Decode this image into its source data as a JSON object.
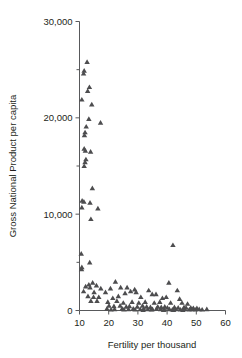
{
  "chart_data": {
    "type": "scatter",
    "title": "",
    "xlabel": "Fertility per thousand",
    "ylabel": "Gross National Product per capita",
    "xlim": [
      10,
      60
    ],
    "ylim": [
      0,
      30000
    ],
    "xticks": [
      10,
      20,
      30,
      40,
      50,
      60
    ],
    "xticklabels": [
      "10",
      "20",
      "30",
      "40",
      "50",
      "60"
    ],
    "yticks": [
      0,
      10000,
      20000,
      30000
    ],
    "yticklabels": [
      "0",
      "10,000",
      "20,000",
      "30,000"
    ],
    "yticks_minor": [
      5000,
      15000,
      25000
    ],
    "grid": false,
    "legend": null,
    "marker": "triangle",
    "marker_color": "#4d4d4f",
    "points": [
      [
        12.6,
        25800
      ],
      [
        11.6,
        24900
      ],
      [
        11.4,
        24600
      ],
      [
        13.4,
        23200
      ],
      [
        12.8,
        22800
      ],
      [
        10.8,
        21900
      ],
      [
        14.2,
        21400
      ],
      [
        13.2,
        19900
      ],
      [
        17.2,
        19500
      ],
      [
        12.3,
        19100
      ],
      [
        11.9,
        18500
      ],
      [
        11.7,
        18200
      ],
      [
        11.6,
        16800
      ],
      [
        12.0,
        16600
      ],
      [
        13.8,
        16500
      ],
      [
        12.2,
        15700
      ],
      [
        11.9,
        15400
      ],
      [
        11.6,
        15000
      ],
      [
        14.4,
        12700
      ],
      [
        10.9,
        11400
      ],
      [
        11.5,
        11300
      ],
      [
        13.6,
        11200
      ],
      [
        10.8,
        10700
      ],
      [
        16.3,
        10600
      ],
      [
        13.9,
        9500
      ],
      [
        10.6,
        5900
      ],
      [
        13.5,
        5000
      ],
      [
        10.8,
        4500
      ],
      [
        10.7,
        4300
      ],
      [
        42.0,
        6800
      ],
      [
        14.5,
        2900
      ],
      [
        13.2,
        2700
      ],
      [
        15.8,
        2600
      ],
      [
        22.3,
        3000
      ],
      [
        40.6,
        2900
      ],
      [
        12.1,
        2500
      ],
      [
        13.6,
        2400
      ],
      [
        17.3,
        2300
      ],
      [
        20.6,
        2300
      ],
      [
        24.1,
        2400
      ],
      [
        26.3,
        2400
      ],
      [
        28.9,
        2200
      ],
      [
        33.7,
        2100
      ],
      [
        43.5,
        2100
      ],
      [
        11.4,
        2000
      ],
      [
        15.0,
        1900
      ],
      [
        18.9,
        1900
      ],
      [
        25.6,
        1800
      ],
      [
        27.5,
        2000
      ],
      [
        29.4,
        1900
      ],
      [
        34.9,
        1700
      ],
      [
        36.2,
        1700
      ],
      [
        12.9,
        1500
      ],
      [
        14.8,
        1400
      ],
      [
        16.6,
        1400
      ],
      [
        21.4,
        1300
      ],
      [
        23.3,
        1500
      ],
      [
        31.0,
        1400
      ],
      [
        38.4,
        1300
      ],
      [
        39.7,
        1400
      ],
      [
        44.3,
        1200
      ],
      [
        13.9,
        1000
      ],
      [
        16.0,
        1000
      ],
      [
        19.7,
        900
      ],
      [
        22.8,
        1000
      ],
      [
        25.0,
        800
      ],
      [
        28.0,
        900
      ],
      [
        30.3,
        800
      ],
      [
        32.5,
        900
      ],
      [
        35.6,
        800
      ],
      [
        37.5,
        900
      ],
      [
        41.2,
        800
      ],
      [
        45.1,
        800
      ],
      [
        47.0,
        700
      ],
      [
        20.1,
        500
      ],
      [
        21.8,
        450
      ],
      [
        23.9,
        500
      ],
      [
        26.0,
        400
      ],
      [
        27.1,
        450
      ],
      [
        29.8,
        400
      ],
      [
        31.6,
        500
      ],
      [
        33.0,
        400
      ],
      [
        34.3,
        350
      ],
      [
        36.8,
        400
      ],
      [
        38.0,
        350
      ],
      [
        39.2,
        400
      ],
      [
        40.1,
        300
      ],
      [
        42.5,
        350
      ],
      [
        43.8,
        300
      ],
      [
        45.8,
        350
      ],
      [
        46.5,
        300
      ],
      [
        48.1,
        300
      ],
      [
        49.0,
        250
      ],
      [
        50.2,
        250
      ],
      [
        19.4,
        200
      ],
      [
        22.0,
        150
      ],
      [
        24.6,
        200
      ],
      [
        26.8,
        150
      ],
      [
        28.4,
        200
      ],
      [
        30.8,
        150
      ],
      [
        32.0,
        200
      ],
      [
        33.4,
        150
      ],
      [
        35.0,
        150
      ],
      [
        36.4,
        200
      ],
      [
        37.8,
        150
      ],
      [
        39.0,
        100
      ],
      [
        40.8,
        150
      ],
      [
        41.8,
        100
      ],
      [
        43.0,
        150
      ],
      [
        44.6,
        100
      ],
      [
        46.0,
        150
      ],
      [
        47.6,
        100
      ],
      [
        48.6,
        150
      ],
      [
        49.6,
        100
      ],
      [
        51.0,
        150
      ],
      [
        52.0,
        100
      ],
      [
        53.6,
        150
      ],
      [
        20.8,
        100
      ],
      [
        25.2,
        100
      ],
      [
        29.0,
        100
      ],
      [
        31.8,
        50
      ],
      [
        34.6,
        100
      ],
      [
        38.8,
        50
      ],
      [
        42.2,
        50
      ],
      [
        45.4,
        50
      ]
    ]
  }
}
